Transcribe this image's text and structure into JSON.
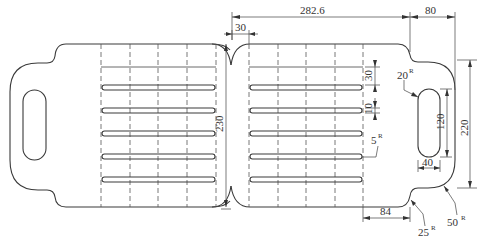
{
  "drawing": {
    "title": "Folding slatted tray — dimensioned part outline",
    "units": "mm",
    "dimensions": {
      "overall_half_length": "282.6",
      "tab_length": "80",
      "center_offset": "30",
      "height": "230",
      "tab_height": "220",
      "slot_length": "120",
      "slot_width": "40",
      "slat_spacing": "30",
      "slat_width": "10",
      "tab_offset": "84"
    },
    "radii": {
      "slot_radius": {
        "value": "20",
        "suffix": "R"
      },
      "slat_radius": {
        "value": "5",
        "suffix": "R"
      },
      "corner_radius": {
        "value": "25",
        "suffix": "R"
      },
      "tab_radius": {
        "value": "50",
        "suffix": "R"
      }
    },
    "features": {
      "slats_per_half": 5,
      "dashed_fold_lines_per_half": 5,
      "handle_slots": 2
    }
  }
}
